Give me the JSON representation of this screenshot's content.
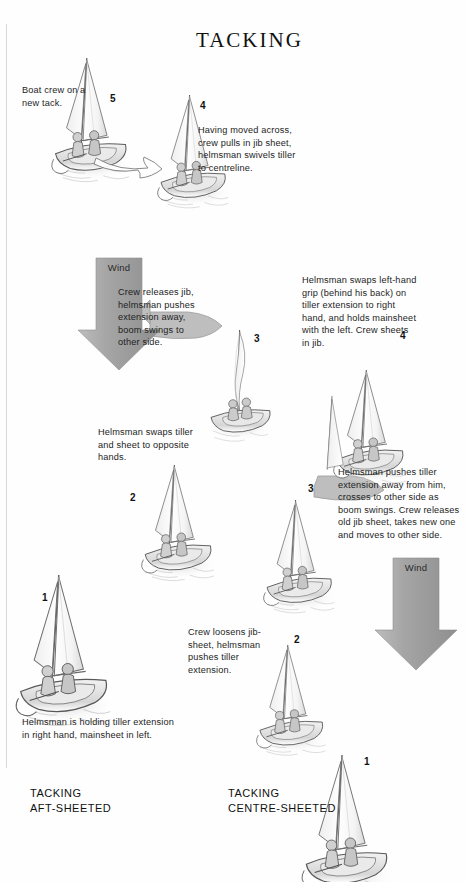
{
  "document": {
    "title": "TACKING",
    "page_background": "#fefefe",
    "ink_color": "#1a1a1a"
  },
  "captions": {
    "left": "TACKING\nAFT-SHEETED",
    "left_line1": "TACKING",
    "left_line2": "AFT-SHEETED",
    "right_line1": "TACKING",
    "right_line2": "CENTRE-SHEETED"
  },
  "wind_arrows": [
    {
      "label": "Wind",
      "x": 96,
      "y": 258,
      "width": 46,
      "height": 112,
      "color": "#9a9a9a"
    },
    {
      "label": "Wind",
      "x": 393,
      "y": 558,
      "width": 46,
      "height": 112,
      "color": "#9a9a9a"
    }
  ],
  "sequence_aft_sheeted": {
    "name": "TACKING AFT-SHEETED",
    "steps": [
      {
        "number": "1",
        "text": "Helmsman is holding tiller extension in right hand, mainsheet in left.",
        "boat_x": 14,
        "boat_y": 575,
        "label_x": 42,
        "label_y": 592,
        "note_x": 22,
        "note_y": 716,
        "note_w": 150
      },
      {
        "number": "2",
        "text": "Helmsman swaps tiller and sheet to opposite hands.",
        "boat_x": 140,
        "boat_y": 465,
        "label_x": 130,
        "label_y": 492,
        "note_x": 98,
        "note_y": 426,
        "note_w": 110
      },
      {
        "number": "3",
        "text": "Crew releases jib, helmsman pushes extension away, boom swings to other side.",
        "boat_x": 206,
        "boat_y": 330,
        "label_x": 254,
        "label_y": 333,
        "note_x": 118,
        "note_y": 286,
        "note_w": 88
      },
      {
        "number": "4",
        "text": "Having moved across, crew pulls in jib sheet, helmsman swivels tiller to centreline.",
        "boat_x": 156,
        "boat_y": 95,
        "label_x": 200,
        "label_y": 100,
        "note_x": 198,
        "note_y": 124,
        "note_w": 104
      },
      {
        "number": "5",
        "text": "Boat crew on a new tack.",
        "boat_x": 50,
        "boat_y": 58,
        "label_x": 110,
        "label_y": 93,
        "note_x": 22,
        "note_y": 84,
        "note_w": 80
      }
    ]
  },
  "sequence_centre_sheeted": {
    "name": "TACKING CENTRE-SHEETED",
    "steps": [
      {
        "number": "1",
        "text": "",
        "boat_x": 300,
        "boat_y": 755,
        "label_x": 364,
        "label_y": 756
      },
      {
        "number": "2",
        "text": "Crew loosens jib-sheet, helmsman pushes tiller extension.",
        "boat_x": 255,
        "boat_y": 645,
        "label_x": 294,
        "label_y": 634,
        "note_x": 188,
        "note_y": 626,
        "note_w": 92
      },
      {
        "number": "3",
        "text": "Helmsman pushes tiller extension away from him, crosses to other side as boom swings. Crew releases old jib sheet, takes new one and moves to other side.",
        "boat_x": 262,
        "boat_y": 500,
        "label_x": 308,
        "label_y": 483,
        "note_x": 338,
        "note_y": 466,
        "note_w": 126
      },
      {
        "number": "4",
        "text": "Helmsman swaps left-hand grip (behind his back) on tiller extension to right hand, and holds mainsheet with the left. Crew sheets in jib.",
        "boat_x": 332,
        "boat_y": 370,
        "label_x": 400,
        "label_y": 330,
        "note_x": 302,
        "note_y": 274,
        "note_w": 114
      }
    ]
  },
  "icons": {
    "wind_arrow": "down-arrow-icon",
    "boom_swing": "curved-arrow-icon"
  }
}
